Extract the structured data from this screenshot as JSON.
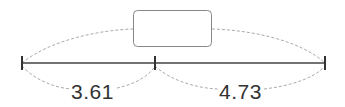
{
  "diagram": {
    "type": "bar-model-number-line",
    "unknown_box": {
      "label": "",
      "description": "empty box representing the total"
    },
    "segments": [
      {
        "label": "3.61"
      },
      {
        "label": "4.73"
      }
    ],
    "colors": {
      "line": "#444444",
      "dashed": "#aaaaaa",
      "box_border": "#888888",
      "text": "#333333"
    }
  }
}
